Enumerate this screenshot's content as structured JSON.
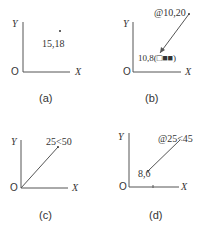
{
  "panels": [
    {
      "caption": "(a)",
      "y_axis": "Y",
      "x_axis": "X",
      "origin": "O",
      "point_label": "15,18"
    },
    {
      "caption": "(b)",
      "y_axis": "Y",
      "x_axis": "X",
      "origin": "O",
      "end_label": "@10,20",
      "start_label": "10,8(□■■)"
    },
    {
      "caption": "(c)",
      "y_axis": "Y",
      "x_axis": "X",
      "origin": "O",
      "end_label": "25<50"
    },
    {
      "caption": "(d)",
      "y_axis": "Y",
      "x_axis": "X",
      "origin": "O",
      "end_label": "@25<45",
      "start_label": "8,6"
    }
  ],
  "colors": {
    "line": "#555555",
    "text": "#333333"
  }
}
